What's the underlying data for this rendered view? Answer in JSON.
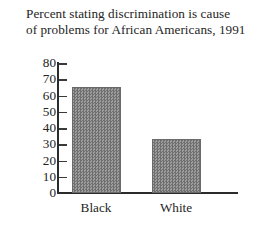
{
  "chart_data": {
    "type": "bar",
    "title": "Percent stating discrimination is cause of problems for African Americans, 1991",
    "title_lines": [
      "Percent stating discrimination is cause",
      "of problems for African Americans, 1991"
    ],
    "categories": [
      "Black",
      "White"
    ],
    "values": [
      65,
      33
    ],
    "xlabel": "",
    "ylabel": "",
    "ylim": [
      0,
      80
    ],
    "ytick_labels": [
      "80",
      "70",
      "60",
      "50",
      "40",
      "30",
      "20",
      "10",
      "0"
    ],
    "ytick_values": [
      80,
      70,
      60,
      50,
      40,
      30,
      20,
      10,
      0
    ],
    "grid": false,
    "legend": false,
    "bar_color": "#878787",
    "axis_color": "#2b2b2b",
    "text_color": "#242424",
    "background": "#ffffff"
  }
}
